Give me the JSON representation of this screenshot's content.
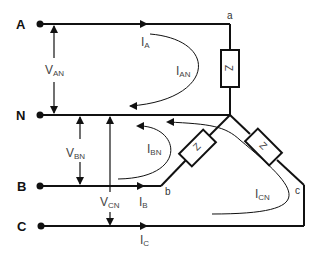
{
  "diagram": {
    "title": "",
    "type": "three-phase wye-connected load",
    "terminals": [
      {
        "id": "A",
        "label": "A"
      },
      {
        "id": "N",
        "label": "N"
      },
      {
        "id": "B",
        "label": "B"
      },
      {
        "id": "C",
        "label": "C"
      }
    ],
    "nodes": [
      {
        "id": "a",
        "label": "a"
      },
      {
        "id": "b",
        "label": "b"
      },
      {
        "id": "c",
        "label": "c"
      }
    ],
    "impedances": [
      {
        "id": "Za",
        "label": "Z"
      },
      {
        "id": "Zb",
        "label": "Z"
      },
      {
        "id": "Zc",
        "label": "Z"
      }
    ],
    "voltages": [
      {
        "id": "VAN",
        "main": "V",
        "sub": "AN"
      },
      {
        "id": "VBN",
        "main": "V",
        "sub": "BN"
      },
      {
        "id": "VCN",
        "main": "V",
        "sub": "CN"
      }
    ],
    "line_currents": [
      {
        "id": "IA",
        "main": "I",
        "sub": "A"
      },
      {
        "id": "IB",
        "main": "I",
        "sub": "B"
      },
      {
        "id": "IC",
        "main": "I",
        "sub": "C"
      }
    ],
    "phase_currents": [
      {
        "id": "IAN",
        "main": "I",
        "sub": "AN"
      },
      {
        "id": "IBN",
        "main": "I",
        "sub": "BN"
      },
      {
        "id": "ICN",
        "main": "I",
        "sub": "CN"
      }
    ],
    "colors": {
      "wire": "#111111",
      "label": "#444444",
      "background": "#ffffff"
    }
  }
}
